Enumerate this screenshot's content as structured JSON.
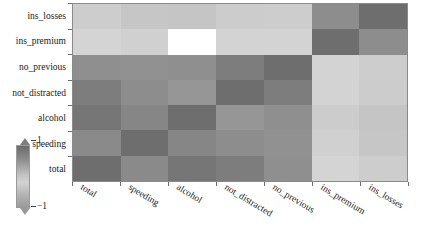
{
  "chart_data": {
    "type": "heatmap",
    "title": "",
    "xlabel": "",
    "ylabel": "",
    "colormap": "grayscale",
    "grid": false,
    "legend_position": "left",
    "colorbar": {
      "max_label": "1",
      "min_label": "−1",
      "orientation": "vertical",
      "extend": "both"
    },
    "x_categories": [
      "total",
      "speeding",
      "alcohol",
      "not_distracted",
      "no_previous",
      "ins_premium",
      "ins_losses"
    ],
    "y_categories": [
      "ins_losses",
      "ins_premium",
      "no_previous",
      "not_distracted",
      "alcohol",
      "speeding",
      "total"
    ],
    "zlim": [
      -1,
      1
    ],
    "matrix": [
      [
        -0.04,
        0.14,
        0.16,
        -0.02,
        -0.04,
        0.62,
        1.0
      ],
      [
        -0.2,
        -0.08,
        -0.02,
        -0.17,
        -0.17,
        1.0,
        0.62
      ],
      [
        0.58,
        0.56,
        0.58,
        0.75,
        1.0,
        -0.17,
        -0.04
      ],
      [
        0.75,
        0.59,
        0.48,
        1.0,
        0.75,
        -0.17,
        -0.02
      ],
      [
        0.85,
        0.66,
        1.0,
        0.48,
        0.58,
        -0.02,
        0.16
      ],
      [
        0.61,
        1.0,
        0.66,
        0.59,
        0.56,
        -0.08,
        0.14
      ],
      [
        1.0,
        0.61,
        0.85,
        0.75,
        0.58,
        -0.2,
        -0.04
      ]
    ],
    "cell_colors": [
      [
        "#cdcdcd",
        "#c6c6c6",
        "#c5c5c5",
        "#cccccc",
        "#cdcdcd",
        "#8d8d8d",
        "#6e6e6e"
      ],
      [
        "#d4d4d4",
        "#d0d0d0",
        "#ccccccc",
        "#d3d3d3",
        "#d3d3d3",
        "#6e6e6e",
        "#8d8d8d"
      ],
      [
        "#8f8f8f",
        "#919191",
        "#8f8f8f",
        "#7d7d7d",
        "#6e6e6e",
        "#d3d3d3",
        "#cdcdcd"
      ],
      [
        "#7d7d7d",
        "#8d8d8d",
        "#969696",
        "#6e6e6e",
        "#7d7d7d",
        "#d3d3d3",
        "#cccccc"
      ],
      [
        "#767676",
        "#868686",
        "#6e6e6e",
        "#969696",
        "#8f8f8f",
        "#cccccc",
        "#c5c5c5"
      ],
      [
        "#8a8a8a",
        "#6e6e6e",
        "#868686",
        "#8d8d8d",
        "#919191",
        "#d0d0d0",
        "#c6c6c6"
      ],
      [
        "#6e6e6e",
        "#8a8a8a",
        "#767676",
        "#7d7d7d",
        "#8f8f8f",
        "#d4d4d4",
        "#cdcdcd"
      ]
    ]
  }
}
